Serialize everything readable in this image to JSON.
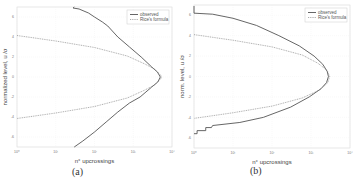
{
  "chart_data": [
    {
      "type": "line",
      "panel": "a",
      "caption": "(a)",
      "xlabel": "n° upcrossings",
      "ylabel": "normalized level, u /σ",
      "xscale": "log",
      "xlim": [
        1,
        10000
      ],
      "ylim": [
        -7,
        7
      ],
      "xticks": [
        1,
        10,
        100,
        1000,
        10000
      ],
      "xtick_labels": [
        "10⁰",
        "10¹",
        "10²",
        "10³",
        "10⁴"
      ],
      "yticks": [
        -6,
        -4,
        -2,
        0,
        2,
        4,
        6
      ],
      "ytick_labels": [
        "-6",
        "-4",
        "-2",
        "0",
        "2",
        "4",
        "6"
      ],
      "grid": true,
      "legend": "top-right",
      "series": [
        {
          "name": "observed",
          "style": "solid",
          "color": "#555555",
          "points": [
            [
              30,
              7.0
            ],
            [
              28,
              6.9
            ],
            [
              40,
              6.8
            ],
            [
              70,
              6.4
            ],
            [
              100,
              6.0
            ],
            [
              160,
              5.5
            ],
            [
              220,
              5.1
            ],
            [
              400,
              4.0
            ],
            [
              800,
              3.0
            ],
            [
              1600,
              2.0
            ],
            [
              3000,
              1.0
            ],
            [
              4200,
              0.5
            ],
            [
              5000,
              0.0
            ],
            [
              4300,
              -0.5
            ],
            [
              3000,
              -1.0
            ],
            [
              1500,
              -2.0
            ],
            [
              800,
              -2.6
            ],
            [
              400,
              -3.5
            ],
            [
              200,
              -4.5
            ],
            [
              100,
              -5.5
            ],
            [
              50,
              -6.4
            ],
            [
              30,
              -7.0
            ]
          ]
        },
        {
          "name": "Rice's formula",
          "style": "dotted",
          "color": "#888888",
          "points": [
            [
              1,
              4.15
            ],
            [
              10,
              3.6
            ],
            [
              100,
              2.95
            ],
            [
              700,
              2.1
            ],
            [
              2000,
              1.3
            ],
            [
              3500,
              0.8
            ],
            [
              4800,
              0.3
            ],
            [
              5500,
              0.0
            ],
            [
              4800,
              -0.3
            ],
            [
              3500,
              -0.8
            ],
            [
              2000,
              -1.3
            ],
            [
              700,
              -2.1
            ],
            [
              100,
              -2.95
            ],
            [
              10,
              -3.6
            ],
            [
              1,
              -4.15
            ]
          ]
        }
      ]
    },
    {
      "type": "line",
      "panel": "b",
      "caption": "(b)",
      "xlabel": "n° upcrossings",
      "ylabel": "norm. level, u /σ",
      "xscale": "log",
      "xlim": [
        1,
        10000
      ],
      "ylim": [
        -7,
        7
      ],
      "xticks": [
        1,
        10,
        100,
        1000,
        10000
      ],
      "xtick_labels": [
        "10⁰",
        "10¹",
        "10²",
        "10³",
        "10⁴"
      ],
      "yticks": [
        -6,
        -4,
        -2,
        0,
        2,
        4,
        6
      ],
      "ytick_labels": [
        "-6",
        "-4",
        "-2",
        "0",
        "2",
        "4",
        "6"
      ],
      "grid": true,
      "legend": "top-right",
      "series": [
        {
          "name": "observed",
          "style": "solid",
          "color": "#555555",
          "points": [
            [
              1,
              6.9
            ],
            [
              1,
              6.2
            ],
            [
              3,
              6.1
            ],
            [
              10,
              5.7
            ],
            [
              40,
              5.0
            ],
            [
              150,
              4.0
            ],
            [
              500,
              3.0
            ],
            [
              1200,
              2.0
            ],
            [
              2000,
              1.2
            ],
            [
              2600,
              0.5
            ],
            [
              2800,
              0.0
            ],
            [
              2500,
              -0.6
            ],
            [
              1800,
              -1.2
            ],
            [
              900,
              -2.0
            ],
            [
              300,
              -3.0
            ],
            [
              60,
              -4.0
            ],
            [
              15,
              -4.5
            ],
            [
              3,
              -4.8
            ],
            [
              2.8,
              -5.0
            ],
            [
              2,
              -5.0
            ],
            [
              2,
              -5.3
            ],
            [
              1.2,
              -5.3
            ],
            [
              1.2,
              -5.6
            ],
            [
              1,
              -5.6
            ]
          ]
        },
        {
          "name": "Rice's formula",
          "style": "dotted",
          "color": "#888888",
          "points": [
            [
              1,
              4.1
            ],
            [
              10,
              3.55
            ],
            [
              100,
              2.9
            ],
            [
              600,
              2.1
            ],
            [
              1500,
              1.3
            ],
            [
              2600,
              0.6
            ],
            [
              3000,
              0.0
            ],
            [
              2700,
              -0.6
            ],
            [
              1700,
              -1.3
            ],
            [
              600,
              -2.1
            ],
            [
              100,
              -2.9
            ],
            [
              10,
              -3.55
            ],
            [
              1,
              -4.1
            ]
          ]
        }
      ]
    }
  ]
}
